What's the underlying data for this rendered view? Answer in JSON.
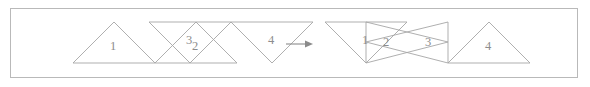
{
  "figure": {
    "caption": "",
    "frame": {
      "border_color": "#b9b9b9",
      "background": "#ffffff",
      "x": 10,
      "y": 8,
      "width": 568,
      "height": 70
    },
    "stroke_color": "#a6a6a6",
    "label_color": "#8d8d8d",
    "arrow": {
      "symbol": "→",
      "name": "rightwards-arrow",
      "color": "#8b8b8b",
      "x1": 286,
      "x2": 312,
      "y": 44
    },
    "groups": [
      {
        "name": "left-group",
        "id": "before",
        "triangles": [
          {
            "label": "1",
            "orientation": "up",
            "points": "114,22 155,63 73,63",
            "label_x": 113,
            "label_y": 50
          },
          {
            "label": "2",
            "orientation": "up",
            "points": "196,22 237,63 155,63",
            "label_x": 195,
            "label_y": 50
          },
          {
            "label": "3",
            "orientation": "down",
            "points": "190,63 149,22 231,22",
            "label_x": 189,
            "label_y": 44
          },
          {
            "label": "4",
            "orientation": "down",
            "points": "272,63 231,22 313,22",
            "label_x": 271,
            "label_y": 44
          }
        ]
      },
      {
        "name": "right-group",
        "id": "after",
        "triangles": [
          {
            "label": "1",
            "orientation": "down",
            "points": "366,63 325,22 407,22",
            "label_x": 365,
            "label_y": 44
          },
          {
            "label": "2",
            "orientation": "right",
            "points": "366,22 366,63 448,42",
            "label_x": 386,
            "label_y": 46
          },
          {
            "label": "3",
            "orientation": "left",
            "points": "448,22 448,63 366,42",
            "label_x": 428,
            "label_y": 46
          },
          {
            "label": "4",
            "orientation": "up",
            "points": "489,22 530,63 448,63",
            "label_x": 488,
            "label_y": 50
          }
        ]
      }
    ]
  }
}
